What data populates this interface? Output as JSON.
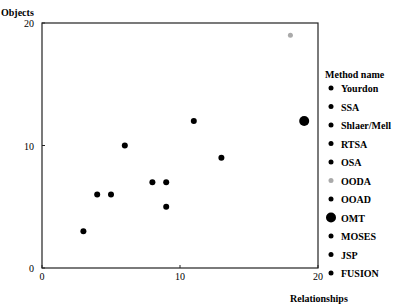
{
  "chart_data": {
    "type": "scatter",
    "title": "",
    "xlabel": "Relationships",
    "ylabel": "Objects",
    "xlim": [
      0,
      20
    ],
    "ylim": [
      0,
      20
    ],
    "xticks": [
      "0",
      "10",
      "20"
    ],
    "yticks": [
      "0",
      "10",
      "20"
    ],
    "grid": false,
    "legend_position": "right",
    "legend_title": "Method name",
    "legend": [
      {
        "name": "Yourdon",
        "color": "#000000",
        "size": "small"
      },
      {
        "name": "SSA",
        "color": "#000000",
        "size": "small"
      },
      {
        "name": "Shlaer/Mell",
        "color": "#000000",
        "size": "small"
      },
      {
        "name": "RTSA",
        "color": "#000000",
        "size": "small"
      },
      {
        "name": "OSA",
        "color": "#000000",
        "size": "small"
      },
      {
        "name": "OODA",
        "color": "#aaaaaa",
        "size": "small"
      },
      {
        "name": "OOAD",
        "color": "#000000",
        "size": "small"
      },
      {
        "name": "OMT",
        "color": "#000000",
        "size": "large"
      },
      {
        "name": "MOSES",
        "color": "#000000",
        "size": "small"
      },
      {
        "name": "JSP",
        "color": "#000000",
        "size": "small"
      },
      {
        "name": "FUSION",
        "color": "#000000",
        "size": "small"
      }
    ],
    "points": [
      {
        "x": 3,
        "y": 3,
        "color": "#000000",
        "r": 3
      },
      {
        "x": 4,
        "y": 6,
        "color": "#000000",
        "r": 3
      },
      {
        "x": 5,
        "y": 6,
        "color": "#000000",
        "r": 3
      },
      {
        "x": 6,
        "y": 10,
        "color": "#000000",
        "r": 3
      },
      {
        "x": 8,
        "y": 7,
        "color": "#000000",
        "r": 3
      },
      {
        "x": 9,
        "y": 7,
        "color": "#000000",
        "r": 3
      },
      {
        "x": 9,
        "y": 5,
        "color": "#000000",
        "r": 3
      },
      {
        "x": 11,
        "y": 12,
        "color": "#000000",
        "r": 3
      },
      {
        "x": 13,
        "y": 9,
        "color": "#000000",
        "r": 3
      },
      {
        "x": 18,
        "y": 19,
        "color": "#aaaaaa",
        "r": 2.5
      },
      {
        "x": 19,
        "y": 12,
        "color": "#000000",
        "r": 5
      }
    ]
  }
}
